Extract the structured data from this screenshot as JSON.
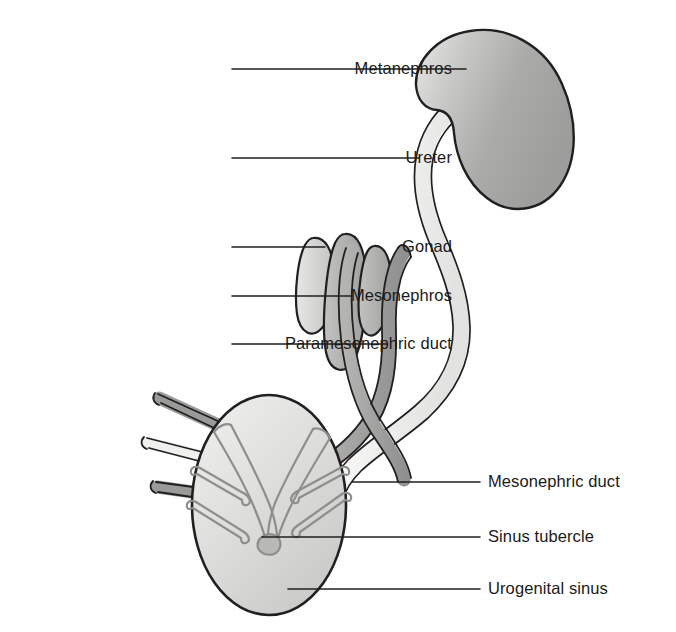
{
  "figure": {
    "background_color": "#ffffff",
    "line_color": "#231f20",
    "text_color": "#1a1a1a"
  },
  "labels": {
    "metanephros": "Metanephros",
    "ureter": "Ureter",
    "gonad": "Gonad",
    "mesonephros": "Mesonephros",
    "paramesonephric_duct": "Paramesonephric duct",
    "mesonephric_duct": "Mesonephric duct",
    "sinus_tubercle": "Sinus tubercle",
    "urogenital_sinus": "Urogenital sinus"
  },
  "structures": {
    "metanephros": {
      "name": "Metanephros",
      "fill": "#a8a8a8",
      "side": "right",
      "shape": "bean"
    },
    "ureter": {
      "name": "Ureter",
      "fill": "#f2f2f0",
      "side": "right",
      "shape": "tube"
    },
    "gonad": {
      "name": "Gonad",
      "fill": "#d6d6d4",
      "side": "left",
      "shape": "elongated-oval"
    },
    "mesonephros": {
      "name": "Mesonephros",
      "fill": "#b3b3b1",
      "side": "left",
      "shape": "elongated-oval"
    },
    "paramesonephric_duct": {
      "name": "Paramesonephric duct",
      "fill": "#9a9a98",
      "shape": "tube"
    },
    "mesonephric_duct": {
      "name": "Mesonephric duct",
      "fill": "#9a9a98",
      "shape": "tube"
    },
    "sinus_tubercle": {
      "name": "Sinus tubercle",
      "fill": "#b0b0ae",
      "shape": "knob"
    },
    "urogenital_sinus": {
      "name": "Urogenital sinus",
      "fill": "#dcdcda",
      "shape": "oval"
    }
  },
  "leader_lines": [
    {
      "for": "metanephros",
      "from": [
        232,
        69
      ],
      "to": [
        466,
        69
      ]
    },
    {
      "for": "ureter",
      "from": [
        232,
        158
      ],
      "to": [
        419,
        158
      ]
    },
    {
      "for": "gonad",
      "from": [
        232,
        247
      ],
      "to": [
        325,
        247
      ]
    },
    {
      "for": "mesonephros",
      "from": [
        232,
        296
      ],
      "to": [
        352,
        296
      ]
    },
    {
      "for": "paramesonephric_duct",
      "from": [
        232,
        344
      ],
      "to": [
        387,
        344
      ]
    },
    {
      "for": "mesonephric_duct",
      "from": [
        352,
        482
      ],
      "to": [
        480,
        482
      ]
    },
    {
      "for": "sinus_tubercle",
      "from": [
        262,
        537
      ],
      "to": [
        480,
        537
      ]
    },
    {
      "for": "urogenital_sinus",
      "from": [
        288,
        589
      ],
      "to": [
        480,
        589
      ]
    }
  ],
  "label_positions": {
    "metanephros": {
      "right": 452,
      "top": 60
    },
    "ureter": {
      "right": 452,
      "top": 149
    },
    "gonad": {
      "right": 452,
      "top": 238
    },
    "mesonephros": {
      "right": 452,
      "top": 287
    },
    "paramesonephric_duct": {
      "right": 452,
      "top": 335
    },
    "mesonephric_duct": {
      "left": 488,
      "top": 473
    },
    "sinus_tubercle": {
      "left": 488,
      "top": 528
    },
    "urogenital_sinus": {
      "left": 488,
      "top": 580
    }
  }
}
